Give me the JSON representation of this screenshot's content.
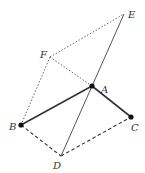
{
  "diagram": {
    "points": {
      "A": {
        "label": "A",
        "x": 92,
        "y": 86,
        "dot": true
      },
      "B": {
        "label": "B",
        "x": 21,
        "y": 125,
        "dot": true
      },
      "C": {
        "label": "C",
        "x": 131,
        "y": 117,
        "dot": true
      },
      "D": {
        "label": "D",
        "x": 61,
        "y": 156,
        "dot": false
      },
      "E": {
        "label": "E",
        "x": 124,
        "y": 14,
        "dot": false
      },
      "F": {
        "label": "F",
        "x": 50,
        "y": 57,
        "dot": false
      }
    },
    "segments": [
      {
        "from": "A",
        "to": "B",
        "style": "solid-thick"
      },
      {
        "from": "A",
        "to": "C",
        "style": "solid-thick"
      },
      {
        "from": "D",
        "to": "E",
        "style": "solid-thin"
      },
      {
        "from": "B",
        "to": "D",
        "style": "dashed"
      },
      {
        "from": "D",
        "to": "C",
        "style": "dashed"
      },
      {
        "from": "F",
        "to": "E",
        "style": "dotted"
      },
      {
        "from": "F",
        "to": "B",
        "style": "dotted"
      },
      {
        "from": "F",
        "to": "A",
        "style": "dotted"
      }
    ],
    "colors": {
      "line": "#333333",
      "dot": "#111111"
    }
  }
}
